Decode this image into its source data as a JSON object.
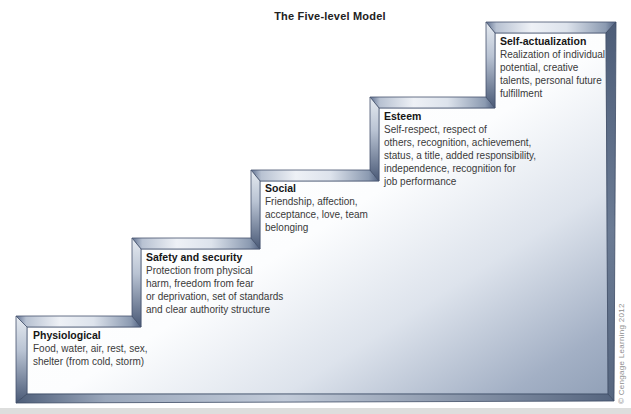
{
  "title": "The Five-level Model",
  "credit": "© Cengage Learning 2012",
  "diagram": {
    "type": "staircase-model",
    "levels_bottom_to_top": 5
  },
  "levels": [
    {
      "name": "Physiological",
      "description": "Food, water, air, rest, sex,\nshelter (from cold, storm)"
    },
    {
      "name": "Safety and security",
      "description": "Protection from physical\nharm, freedom from fear\nor deprivation, set of standards\nand clear authority structure"
    },
    {
      "name": "Social",
      "description": "Friendship, affection,\nacceptance, love, team\nbelonging"
    },
    {
      "name": "Esteem",
      "description": "Self-respect, respect of\nothers, recognition, achievement,\nstatus, a title, added responsibility,\nindependence, recognition for\njob performance"
    },
    {
      "name": "Self-actualization",
      "description": "Realization of individual\npotential, creative\ntalents, personal future\nfulfillment"
    }
  ],
  "palette": {
    "face_light": "#ffffff",
    "face_dark": "#7e90a9",
    "bevel_highlight": "#eef1f6",
    "bevel_shadow": "#45556f",
    "heading_text": "#161616",
    "body_text": "#3a3a3a",
    "credit_text": "#8e8e8e"
  }
}
